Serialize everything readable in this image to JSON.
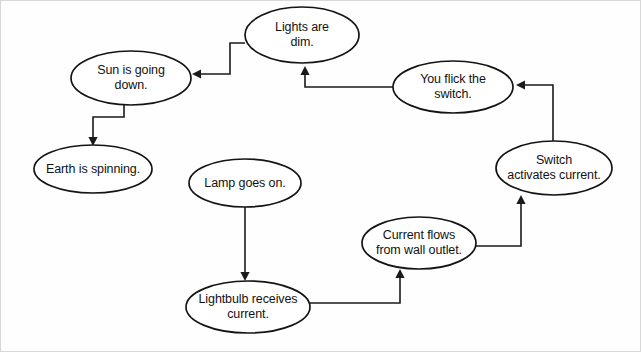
{
  "diagram": {
    "background_color": "#fefefe",
    "node_fill_color": "#ffffff",
    "node_stroke_color": "#141414",
    "edge_color": "#1a1a1a",
    "text_color": "#121212",
    "nodes": [
      {
        "id": "lights-are-dim",
        "label": "Lights are\ndim.",
        "cx": 302,
        "cy": 35,
        "rx": 57,
        "ry": 28
      },
      {
        "id": "sun-is-going-down",
        "label": "Sun is going\ndown.",
        "cx": 131,
        "cy": 78,
        "rx": 60,
        "ry": 27
      },
      {
        "id": "you-flick-the-switch",
        "label": "You flick the\nswitch.",
        "cx": 453,
        "cy": 87,
        "rx": 60,
        "ry": 26
      },
      {
        "id": "earth-is-spinning",
        "label": "Earth is spinning.",
        "cx": 93,
        "cy": 169,
        "rx": 59,
        "ry": 24
      },
      {
        "id": "switch-activates-current",
        "label": "Switch\nactivates current.",
        "cx": 554,
        "cy": 168,
        "rx": 58,
        "ry": 27
      },
      {
        "id": "lamp-goes-on",
        "label": "Lamp goes on.",
        "cx": 245,
        "cy": 183,
        "rx": 56,
        "ry": 24
      },
      {
        "id": "current-flows-from-wall-outlet",
        "label": "Current flows\nfrom wall outlet.",
        "cx": 419,
        "cy": 243,
        "rx": 57,
        "ry": 26
      },
      {
        "id": "lightbulb-receives-current",
        "label": "Lightbulb receives\ncurrent.",
        "cx": 248,
        "cy": 307,
        "rx": 62,
        "ry": 26
      }
    ],
    "edges": [
      {
        "id": "edge-lights-to-sun",
        "from": "lights-are-dim",
        "to": "sun-is-going-down",
        "path": "M 245 43 L 230 43 L 230 74 L 200 74",
        "arrow": {
          "x": 192,
          "y": 74,
          "dir": "left"
        }
      },
      {
        "id": "edge-sun-to-earth",
        "from": "sun-is-going-down",
        "to": "earth-is-spinning",
        "path": "M 124 105 L 124 117 L 93 117 L 93 138",
        "arrow": {
          "x": 93,
          "y": 146,
          "dir": "down"
        }
      },
      {
        "id": "edge-switch-flick-to-lights",
        "from": "you-flick-the-switch",
        "to": "lights-are-dim",
        "path": "M 393 87 L 305 87 L 305 74",
        "arrow": {
          "x": 305,
          "y": 66,
          "dir": "up"
        }
      },
      {
        "id": "edge-activates-to-flick",
        "from": "switch-activates-current",
        "to": "you-flick-the-switch",
        "path": "M 553 141 L 553 85 L 524 85",
        "arrow": {
          "x": 516,
          "y": 85,
          "dir": "left"
        }
      },
      {
        "id": "edge-outlet-to-activates",
        "from": "current-flows-from-wall-outlet",
        "to": "switch-activates-current",
        "path": "M 476 246 L 521 246 L 521 203",
        "arrow": {
          "x": 521,
          "y": 195,
          "dir": "up"
        }
      },
      {
        "id": "edge-lamp-to-lightbulb",
        "from": "lamp-goes-on",
        "to": "lightbulb-receives-current",
        "path": "M 245 207 L 245 273",
        "arrow": {
          "x": 245,
          "y": 281,
          "dir": "down"
        }
      },
      {
        "id": "edge-lightbulb-to-outlet",
        "from": "lightbulb-receives-current",
        "to": "current-flows-from-wall-outlet",
        "path": "M 310 303 L 400 303 L 400 277",
        "arrow": {
          "x": 400,
          "y": 269,
          "dir": "up"
        }
      }
    ]
  }
}
